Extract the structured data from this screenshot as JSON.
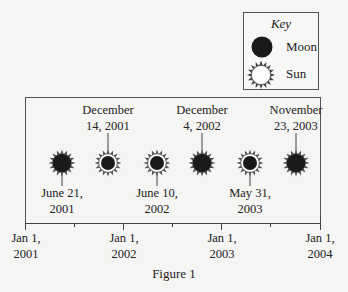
{
  "key": {
    "title": "Key",
    "items": [
      {
        "symbol": "moon-icon",
        "label": "Moon"
      },
      {
        "symbol": "sun-icon",
        "label": "Sun"
      }
    ]
  },
  "events": [
    {
      "date_line1": "June 21,",
      "date_line2": "2001",
      "label_position": "below",
      "type": "total"
    },
    {
      "date_line1": "December",
      "date_line2": "14, 2001",
      "label_position": "above",
      "type": "annular"
    },
    {
      "date_line1": "June 10,",
      "date_line2": "2002",
      "label_position": "below",
      "type": "annular"
    },
    {
      "date_line1": "December",
      "date_line2": "4, 2002",
      "label_position": "above",
      "type": "total"
    },
    {
      "date_line1": "May 31,",
      "date_line2": "2003",
      "label_position": "below",
      "type": "annular"
    },
    {
      "date_line1": "November",
      "date_line2": "23, 2003",
      "label_position": "above",
      "type": "total"
    }
  ],
  "axis": {
    "ticks": [
      {
        "line1": "Jan 1,",
        "line2": "2001"
      },
      {
        "line1": "Jan 1,",
        "line2": "2002"
      },
      {
        "line1": "Jan 1,",
        "line2": "2003"
      },
      {
        "line1": "Jan 1,",
        "line2": "2004"
      }
    ]
  },
  "caption": "Figure 1",
  "colors": {
    "moon": "#1a1a1a",
    "sun_fill": "#ffffff",
    "sun_rays": "#444444",
    "border": "#555555"
  }
}
